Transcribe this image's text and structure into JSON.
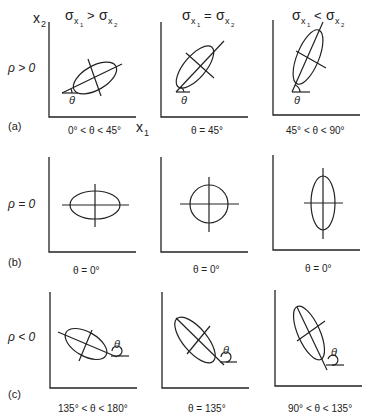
{
  "column_headers": [
    {
      "main": "σ",
      "sub1": "x",
      "sub2": "1",
      "op": ">",
      "main2": "σ",
      "sub3": "x",
      "sub4": "2"
    },
    {
      "main": "σ",
      "sub1": "x",
      "sub2": "1",
      "op": "=",
      "main2": "σ",
      "sub3": "x",
      "sub4": "2"
    },
    {
      "main": "σ",
      "sub1": "x",
      "sub2": "1",
      "op": "<",
      "main2": "σ",
      "sub3": "x",
      "sub4": "2"
    }
  ],
  "axis_labels": {
    "y": "x",
    "y_sub": "2",
    "x": "x",
    "x_sub": "1"
  },
  "rows": [
    {
      "tag": "(a)",
      "rho": "ρ > 0",
      "captions": [
        "0° < θ < 45°",
        "θ = 45°",
        "45° < θ < 90°"
      ]
    },
    {
      "tag": "(b)",
      "rho": "ρ = 0",
      "captions": [
        "θ = 0°",
        "θ = 0°",
        "θ = 0°"
      ]
    },
    {
      "tag": "(c)",
      "rho": "ρ < 0",
      "captions": [
        "135° < θ < 180°",
        "θ = 135°",
        "90° < θ < 135°"
      ]
    }
  ],
  "angle_symbol": "θ"
}
